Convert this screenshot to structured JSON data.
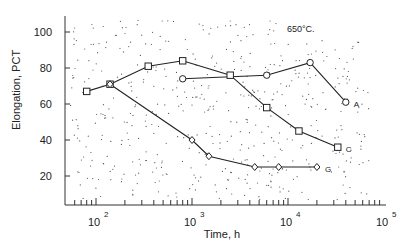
{
  "chart_data": {
    "type": "line",
    "title": "",
    "annotation": "650°C.",
    "xlabel": "Time,  h",
    "ylabel": "Elongation, PCT",
    "xscale": "log",
    "xlim": [
      50,
      100000
    ],
    "ylim": [
      0,
      110
    ],
    "x_tick_labels": [
      {
        "base": "10",
        "exp": "2",
        "value": 100
      },
      {
        "base": "10",
        "exp": "3",
        "value": 1000
      },
      {
        "base": "10",
        "exp": "4",
        "value": 10000
      },
      {
        "base": "10",
        "exp": "5",
        "value": 100000
      }
    ],
    "y_tick_labels": [
      "20",
      "40",
      "60",
      "80",
      "100"
    ],
    "y_ticks": [
      20,
      40,
      60,
      80,
      100
    ],
    "grid": false,
    "legend": "inline end-of-line labels",
    "series": [
      {
        "name": "A",
        "marker": "circle",
        "x": [
          800,
          6000,
          17000,
          40000
        ],
        "y": [
          74,
          76,
          83,
          61
        ]
      },
      {
        "name": "C",
        "marker": "square",
        "x": [
          80,
          140,
          350,
          800,
          2500,
          6000,
          13000,
          33000
        ],
        "y": [
          67,
          71,
          81,
          84,
          76,
          58,
          45,
          36
        ]
      },
      {
        "name": "G",
        "marker": "diamond",
        "x": [
          140,
          1000,
          1500,
          4500,
          8000,
          20000
        ],
        "y": [
          71,
          40,
          31,
          25,
          25,
          25
        ]
      }
    ]
  }
}
